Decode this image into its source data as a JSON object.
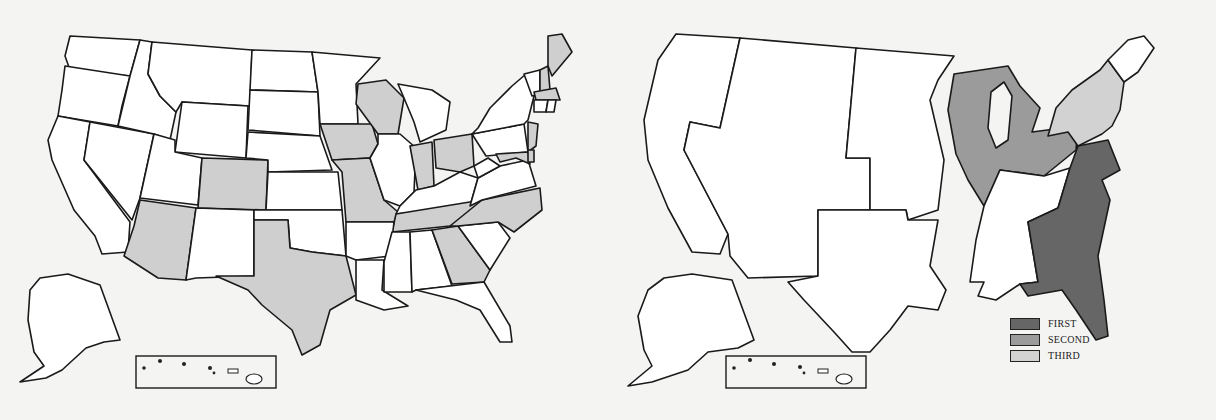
{
  "figure": {
    "left_map": {
      "highlighted_fill": "#cfcfcf",
      "highlighted_states": [
        "Maine",
        "New Hampshire",
        "Massachusetts",
        "New Jersey",
        "Maryland",
        "Delaware",
        "Wisconsin",
        "Iowa",
        "Missouri",
        "Indiana",
        "Ohio",
        "Colorado",
        "Arizona",
        "Texas",
        "Tennessee",
        "North Carolina",
        "Georgia"
      ],
      "inset": "Hawaii"
    },
    "right_map": {
      "regions": [
        {
          "name": "Pacific",
          "tier": "none"
        },
        {
          "name": "Mountain",
          "tier": "none"
        },
        {
          "name": "West North Central",
          "tier": "none"
        },
        {
          "name": "West South Central",
          "tier": "none"
        },
        {
          "name": "East North Central",
          "tier": "second"
        },
        {
          "name": "East South Central",
          "tier": "none"
        },
        {
          "name": "South Atlantic",
          "tier": "first"
        },
        {
          "name": "Middle Atlantic",
          "tier": "third"
        },
        {
          "name": "New England",
          "tier": "none"
        }
      ],
      "inset": "Hawaii"
    }
  },
  "legend": {
    "items": [
      {
        "label": "FIRST",
        "color": "#666666"
      },
      {
        "label": "SECOND",
        "color": "#9b9b9b"
      },
      {
        "label": "THIRD",
        "color": "#d2d2d2"
      }
    ]
  },
  "colors": {
    "background": "#f4f4f2",
    "outline": "#1a1a1a",
    "unshaded": "#ffffff"
  }
}
